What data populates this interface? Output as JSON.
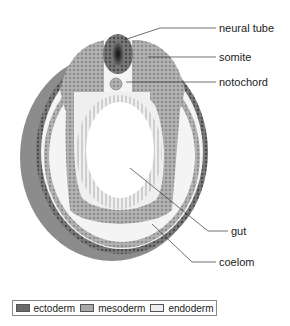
{
  "diagram": {
    "labels": [
      {
        "id": "neural-tube",
        "text": "neural tube"
      },
      {
        "id": "somite",
        "text": "somite"
      },
      {
        "id": "notochord",
        "text": "notochord"
      },
      {
        "id": "gut",
        "text": "gut"
      },
      {
        "id": "coelom",
        "text": "coelom"
      }
    ]
  },
  "legend": {
    "items": [
      {
        "label": "ectoderm",
        "color": "#6a6a6a"
      },
      {
        "label": "mesoderm",
        "color": "#a9a9a9"
      },
      {
        "label": "endoderm",
        "color": "#eeeeee"
      }
    ]
  },
  "colors": {
    "ectoderm": "#6a6a6a",
    "mesoderm": "#a9a9a9",
    "endoderm": "#eeeeee",
    "background_fill": "#f2f2f2",
    "neural_core": "#222222"
  }
}
